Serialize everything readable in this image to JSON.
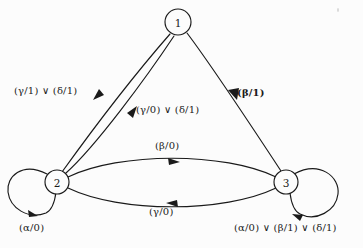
{
  "diagram": {
    "background_color": "#fcfcfc",
    "stroke_color": "#1a1a1a",
    "states": [
      {
        "id": "1",
        "label": "1",
        "cx": 178,
        "cy": 22,
        "r": 13
      },
      {
        "id": "2",
        "label": "2",
        "cx": 57,
        "cy": 182,
        "r": 12
      },
      {
        "id": "3",
        "label": "3",
        "cx": 286,
        "cy": 182,
        "r": 12
      }
    ],
    "transitions": [
      {
        "name": "edge-1-to-2",
        "from": "1",
        "to": "2",
        "label": "(γ/1) ∨ (δ/1)",
        "label_x": 14,
        "label_y": 85,
        "bold": false
      },
      {
        "name": "edge-2-to-1",
        "from": "2",
        "to": "1",
        "label": "(γ/0) ∨ (δ/1)",
        "label_x": 136,
        "label_y": 104,
        "bold": false
      },
      {
        "name": "edge-1-to-3",
        "from": "1",
        "to": "3",
        "label": "(β/1)",
        "label_x": 237,
        "label_y": 87,
        "bold": true
      },
      {
        "name": "edge-2-to-3",
        "from": "2",
        "to": "3",
        "label": "(β/0)",
        "label_x": 155,
        "label_y": 140,
        "bold": false
      },
      {
        "name": "edge-3-to-2",
        "from": "3",
        "to": "2",
        "label": "(γ/0)",
        "label_x": 149,
        "label_y": 206,
        "bold": false
      },
      {
        "name": "self-loop-2",
        "from": "2",
        "to": "2",
        "label": "(α/0)",
        "label_x": 19,
        "label_y": 222,
        "bold": false
      },
      {
        "name": "self-loop-3",
        "from": "3",
        "to": "3",
        "label": "(α/0) ∨ (β/1) ∨ (δ/1)",
        "label_x": 234,
        "label_y": 222,
        "bold": false
      }
    ]
  }
}
